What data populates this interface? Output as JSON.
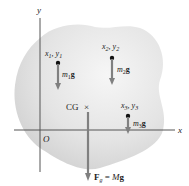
{
  "figure": {
    "axes": {
      "x_label": "x",
      "y_label": "y",
      "origin_label": "O"
    },
    "particles": [
      {
        "coord_label": "x₁, y₁",
        "coord_x": "x",
        "coord_x_sub": "1",
        "coord_y": "y",
        "coord_y_sub": "1",
        "weight_m": "m",
        "weight_sub": "1",
        "weight_g": "g"
      },
      {
        "coord_label": "x₂, y₂",
        "coord_x": "x",
        "coord_x_sub": "2",
        "coord_y": "y",
        "coord_y_sub": "2",
        "weight_m": "m",
        "weight_sub": "2",
        "weight_g": "g"
      },
      {
        "coord_label": "x₃, y₃",
        "coord_x": "x",
        "coord_x_sub": "3",
        "coord_y": "y",
        "coord_y_sub": "3",
        "weight_m": "m",
        "weight_sub": "3",
        "weight_g": "g"
      }
    ],
    "cg": {
      "label": "CG",
      "marker": "×"
    },
    "resultant": {
      "F": "F",
      "sub": "g",
      "eq": " = ",
      "M": "M",
      "g": "g"
    },
    "colors": {
      "body_fill": "#d9d9d9",
      "body_edge": "#c8c8c8",
      "axis": "#555555",
      "arrow": "#808080",
      "dot": "#111111"
    }
  }
}
